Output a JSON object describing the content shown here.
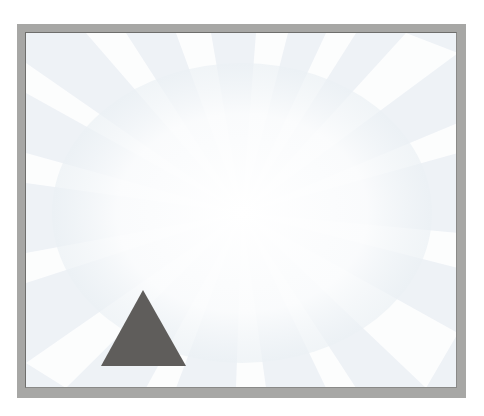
{
  "page": {
    "top_text": ""
  },
  "frame": {
    "border_color": "#a7a7a5",
    "background_color": "#f3f6f8"
  },
  "shapes": [
    {
      "type": "triangle",
      "name": "dark-gray-triangle",
      "fill": "#5f5d5b",
      "points": [
        [
          142,
          289
        ],
        [
          100,
          365
        ],
        [
          185,
          365
        ]
      ]
    }
  ]
}
